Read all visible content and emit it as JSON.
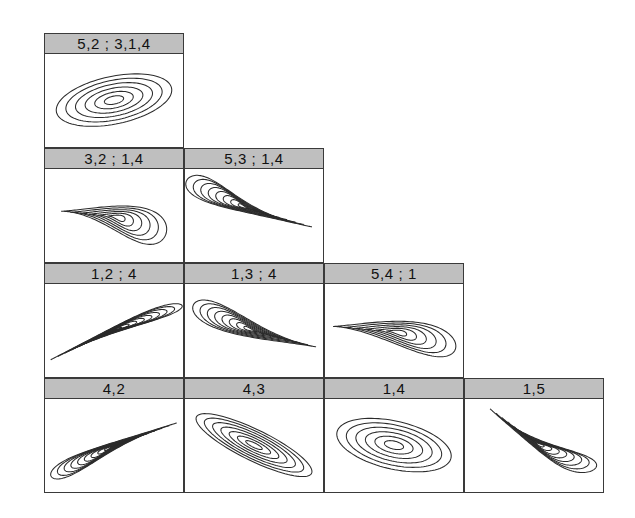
{
  "figure": {
    "type": "contour-panel-grid",
    "layout": "staircase",
    "background": "#ffffff",
    "header_fill": "#bfbfbf",
    "border_color": "#3a3a3a",
    "contour_color": "#2b2b2b",
    "panel_width": 140,
    "panel_height": 115,
    "header_height": 20,
    "origin": {
      "x": 44,
      "y": 33
    },
    "rows": [
      {
        "index": 0,
        "panels": [
          {
            "label": "5,2 ; 3,1,4",
            "shape": "ellipse",
            "tilt": -22,
            "name": "panel-5-2-3-1-4"
          }
        ]
      },
      {
        "index": 1,
        "panels": [
          {
            "label": "3,2 ; 1,4",
            "shape": "teardrop-up",
            "tilt": 0,
            "name": "panel-3-2-1-4"
          },
          {
            "label": "5,3 ; 1,4",
            "shape": "comet-down-right",
            "tilt": 0,
            "name": "panel-5-3-1-4"
          }
        ]
      },
      {
        "index": 2,
        "panels": [
          {
            "label": "1,2 ; 4",
            "shape": "needle-down-right",
            "tilt": 0,
            "name": "panel-1-2-4"
          },
          {
            "label": "1,3 ; 4",
            "shape": "teardrop-down-right",
            "tilt": 0,
            "name": "panel-1-3-4"
          },
          {
            "label": "5,4 ; 1",
            "shape": "teardrop-left",
            "tilt": 0,
            "name": "panel-5-4-1"
          }
        ]
      },
      {
        "index": 3,
        "panels": [
          {
            "label": "4,2",
            "shape": "comet-up-right",
            "tilt": 0,
            "name": "panel-4-2"
          },
          {
            "label": "4,3",
            "shape": "ellipse-narrow",
            "tilt": 38,
            "name": "panel-4-3"
          },
          {
            "label": "1,4",
            "shape": "ellipse",
            "tilt": 24,
            "name": "panel-1-4"
          },
          {
            "label": "1,5",
            "shape": "comet-up-right-steep",
            "tilt": 0,
            "name": "panel-1-5"
          }
        ]
      }
    ]
  },
  "chart_data": {
    "type": "contour",
    "title": "",
    "xlabel": "",
    "ylabel": "",
    "n_contour_levels": 7,
    "panels": [
      {
        "id": "5,2 ; 3,1,4",
        "row": 1,
        "col": 1,
        "orientation_deg": -22,
        "eccentricity": 0.78,
        "skew": "none",
        "levels": 6
      },
      {
        "id": "3,2 ; 1,4",
        "row": 2,
        "col": 1,
        "orientation_deg": -10,
        "eccentricity": 0.6,
        "skew": "lower-left",
        "levels": 6
      },
      {
        "id": "5,3 ; 1,4",
        "row": 2,
        "col": 2,
        "orientation_deg": -38,
        "eccentricity": 0.97,
        "skew": "strong-lower-right",
        "levels": 7
      },
      {
        "id": "1,2 ; 4",
        "row": 3,
        "col": 1,
        "orientation_deg": -32,
        "eccentricity": 0.99,
        "skew": "strong-upper-left",
        "levels": 8
      },
      {
        "id": "1,3 ; 4",
        "row": 3,
        "col": 2,
        "orientation_deg": -28,
        "eccentricity": 0.93,
        "skew": "upper-left",
        "levels": 8
      },
      {
        "id": "5,4 ; 1",
        "row": 3,
        "col": 3,
        "orientation_deg": -22,
        "eccentricity": 0.86,
        "skew": "right",
        "levels": 6
      },
      {
        "id": "4,2",
        "row": 4,
        "col": 1,
        "orientation_deg": 35,
        "eccentricity": 0.97,
        "skew": "strong-upper-right",
        "levels": 8
      },
      {
        "id": "4,3",
        "row": 4,
        "col": 2,
        "orientation_deg": 38,
        "eccentricity": 0.94,
        "skew": "none",
        "levels": 8
      },
      {
        "id": "1,4",
        "row": 4,
        "col": 3,
        "orientation_deg": 24,
        "eccentricity": 0.75,
        "skew": "none",
        "levels": 6
      },
      {
        "id": "1,5",
        "row": 4,
        "col": 4,
        "orientation_deg": 46,
        "eccentricity": 0.96,
        "skew": "strong-lower-left",
        "levels": 8
      }
    ]
  }
}
